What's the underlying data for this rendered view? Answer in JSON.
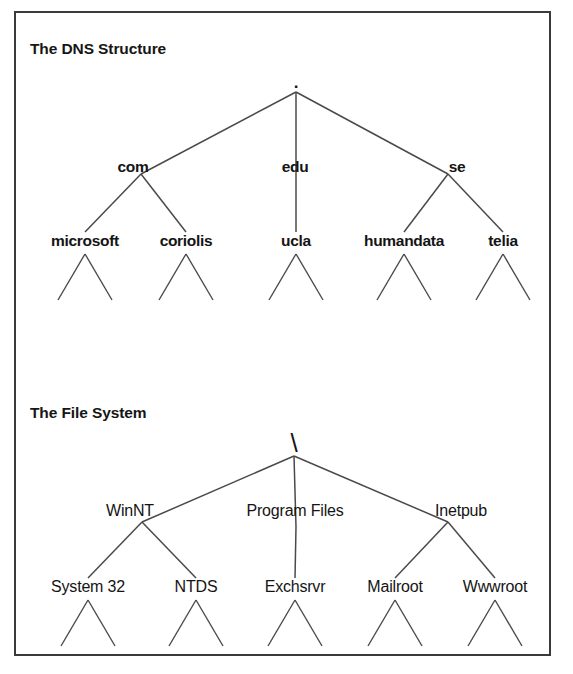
{
  "figure": {
    "background_color": "#ffffff",
    "border_color": "#3a3a3a",
    "line_color": "#4a4a4a",
    "text_color": "#141414"
  },
  "sections": [
    {
      "id": "dns",
      "title": "The DNS Structure",
      "title_x": 30,
      "title_y": 54,
      "root": {
        "label": ".",
        "x": 296,
        "y": 88,
        "style": "root-dot"
      },
      "level2": [
        {
          "label": "com",
          "x": 133,
          "y": 172,
          "style": "bold",
          "join_x": 141,
          "join_y": 174
        },
        {
          "label": "edu",
          "x": 295,
          "y": 172,
          "style": "bold",
          "join_x": 296,
          "join_y": 181
        },
        {
          "label": "se",
          "x": 457,
          "y": 172,
          "style": "bold",
          "join_x": 448,
          "join_y": 174
        }
      ],
      "level3": [
        {
          "label": "microsoft",
          "x": 85,
          "y": 246,
          "style": "bold",
          "parent": 0
        },
        {
          "label": "coriolis",
          "x": 186,
          "y": 246,
          "style": "bold",
          "parent": 0
        },
        {
          "label": "ucla",
          "x": 296,
          "y": 246,
          "style": "bold",
          "parent": 1
        },
        {
          "label": "humandata",
          "x": 404,
          "y": 246,
          "style": "bold",
          "parent": 2
        },
        {
          "label": "telia",
          "x": 503,
          "y": 246,
          "style": "bold",
          "parent": 2
        }
      ],
      "leaf_top_y": 254,
      "leaf_bottom_y": 300,
      "leaf_spread": 27
    },
    {
      "id": "filesystem",
      "title": "The File System",
      "title_x": 30,
      "title_y": 418,
      "root": {
        "label": "\\",
        "x": 294,
        "y": 452,
        "style": "root-slash"
      },
      "level2": [
        {
          "label": "WinNT",
          "x": 130,
          "y": 516,
          "style": "regular",
          "join_x": 142,
          "join_y": 522
        },
        {
          "label": "Program Files",
          "x": 295,
          "y": 516,
          "style": "regular",
          "join_x": 296,
          "join_y": 527
        },
        {
          "label": "Inetpub",
          "x": 461,
          "y": 516,
          "style": "regular",
          "join_x": 448,
          "join_y": 522
        }
      ],
      "level3": [
        {
          "label": "System 32",
          "x": 88,
          "y": 592,
          "style": "regular",
          "parent": 0
        },
        {
          "label": "NTDS",
          "x": 196,
          "y": 592,
          "style": "regular",
          "parent": 0
        },
        {
          "label": "Exchsrvr",
          "x": 295,
          "y": 592,
          "style": "regular",
          "parent": 1
        },
        {
          "label": "Mailroot",
          "x": 395,
          "y": 592,
          "style": "regular",
          "parent": 2
        },
        {
          "label": "Wwwroot",
          "x": 495,
          "y": 592,
          "style": "regular",
          "parent": 2
        }
      ],
      "leaf_top_y": 600,
      "leaf_bottom_y": 646,
      "leaf_spread": 27
    }
  ],
  "chart_data": {
    "type": "diagram",
    "subtype": "hierarchical-tree",
    "diagrams": [
      {
        "name": "The DNS Structure",
        "root": ".",
        "nodes": [
          {
            "label": "com",
            "level": 1,
            "parent": "."
          },
          {
            "label": "edu",
            "level": 1,
            "parent": "."
          },
          {
            "label": "se",
            "level": 1,
            "parent": "."
          },
          {
            "label": "microsoft",
            "level": 2,
            "parent": "com"
          },
          {
            "label": "coriolis",
            "level": 2,
            "parent": "com"
          },
          {
            "label": "ucla",
            "level": 2,
            "parent": "edu"
          },
          {
            "label": "humandata",
            "level": 2,
            "parent": "se"
          },
          {
            "label": "telia",
            "level": 2,
            "parent": "se"
          }
        ],
        "unlabeled_leaves_per_level3_node": 2
      },
      {
        "name": "The File System",
        "root": "\\",
        "nodes": [
          {
            "label": "WinNT",
            "level": 1,
            "parent": "\\"
          },
          {
            "label": "Program Files",
            "level": 1,
            "parent": "\\"
          },
          {
            "label": "Inetpub",
            "level": 1,
            "parent": "\\"
          },
          {
            "label": "System 32",
            "level": 2,
            "parent": "WinNT"
          },
          {
            "label": "NTDS",
            "level": 2,
            "parent": "WinNT"
          },
          {
            "label": "Exchsrvr",
            "level": 2,
            "parent": "Program Files"
          },
          {
            "label": "Mailroot",
            "level": 2,
            "parent": "Inetpub"
          },
          {
            "label": "Wwwroot",
            "level": 2,
            "parent": "Inetpub"
          }
        ],
        "unlabeled_leaves_per_level3_node": 2
      }
    ]
  }
}
